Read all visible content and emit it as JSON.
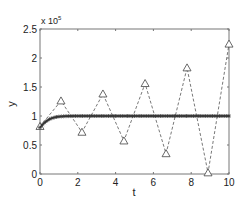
{
  "chart_data": {
    "type": "line",
    "title": "",
    "xlabel": "t",
    "ylabel": "y",
    "y_multiplier_label": "x 10",
    "y_multiplier_exponent": "5",
    "xlim": [
      0,
      10
    ],
    "ylim": [
      0,
      2.5
    ],
    "x_ticks": [
      0,
      2,
      4,
      6,
      8,
      10
    ],
    "x_tick_labels": [
      "0",
      "2",
      "4",
      "6",
      "8",
      "10"
    ],
    "y_ticks": [
      0,
      0.5,
      1,
      1.5,
      2,
      2.5
    ],
    "y_tick_labels": [
      "0",
      "0.5",
      "1",
      "1.5",
      "2",
      "2.5"
    ],
    "grid": false,
    "legend": null,
    "series": [
      {
        "name": "oscillating (triangles, dashed)",
        "marker": "triangle",
        "line_style": "dashed",
        "color": "#555555",
        "x": [
          0,
          1.11,
          2.22,
          3.33,
          4.44,
          5.56,
          6.67,
          7.78,
          8.89,
          10
        ],
        "values": [
          0.82,
          1.26,
          0.72,
          1.38,
          0.57,
          1.56,
          0.35,
          1.83,
          0.02,
          2.24
        ]
      },
      {
        "name": "converging (asterisks, solid)",
        "marker": "asterisk",
        "line_style": "solid",
        "color": "#333333",
        "x": [
          0,
          0.1,
          0.2,
          0.3,
          0.4,
          0.5,
          0.6,
          0.7,
          0.8,
          0.9,
          1.0,
          1.2,
          1.4,
          1.6,
          1.8,
          2.0,
          3.0,
          4.0,
          5.0,
          6.0,
          7.0,
          8.0,
          9.0,
          10.0
        ],
        "values": [
          0.8,
          0.84,
          0.875,
          0.9,
          0.925,
          0.945,
          0.96,
          0.97,
          0.978,
          0.985,
          0.99,
          0.994,
          0.997,
          0.999,
          1.0,
          1.0,
          1.0,
          1.0,
          1.0,
          1.0,
          1.0,
          1.0,
          1.0,
          1.0
        ]
      }
    ]
  },
  "plot_area": {
    "left": 40,
    "right": 229,
    "top": 29,
    "bottom": 174
  },
  "colors": {
    "axis": "#777777",
    "text": "#222222"
  }
}
